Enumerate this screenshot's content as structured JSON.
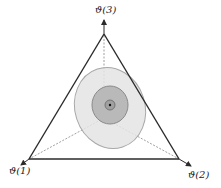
{
  "labels": {
    "top": "ϑ(3)",
    "left": "ϑ(1)",
    "right": "ϑ(2)"
  },
  "colors": {
    "edge": "#2a2a2a",
    "dashed": "#777777",
    "outer_fill": "#e4e4e4",
    "outer_stroke": "#a8a8a8",
    "mid_fill": "#b9b9b9",
    "mid_stroke": "#8a8a8a",
    "inner_fill": "#a0a0a0",
    "dot": "#111111"
  }
}
